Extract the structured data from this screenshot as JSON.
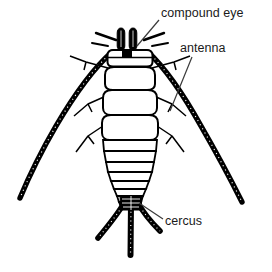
{
  "figure": {
    "background_color": "#ffffff",
    "ink_color": "#000000",
    "label_color": "#1a1a1a",
    "leader_color": "#3a3a3a",
    "width": 272,
    "height": 272
  },
  "labels": [
    {
      "id": "compound-eye",
      "text": "compound eye",
      "x": 161,
      "y": 7,
      "leader": {
        "from_x": 159,
        "from_y": 20,
        "to_x": 137,
        "to_y": 46
      }
    },
    {
      "id": "antenna",
      "text": "antenna",
      "x": 180,
      "y": 42,
      "leader": {
        "from_x": 192,
        "from_y": 57,
        "to_x": 170,
        "to_y": 111
      }
    },
    {
      "id": "cercus",
      "text": "cercus",
      "x": 165,
      "y": 215,
      "leader": {
        "from_x": 163,
        "from_y": 219,
        "to_x": 139,
        "to_y": 203
      }
    }
  ],
  "anatomy": {
    "parts": [
      "compound eye",
      "antenna",
      "cercus",
      "head",
      "thorax",
      "abdomen",
      "legs"
    ],
    "compound_eyes": 2,
    "antennae": 2,
    "cerci": 3,
    "legs": 6,
    "abdominal_segments": 8
  }
}
